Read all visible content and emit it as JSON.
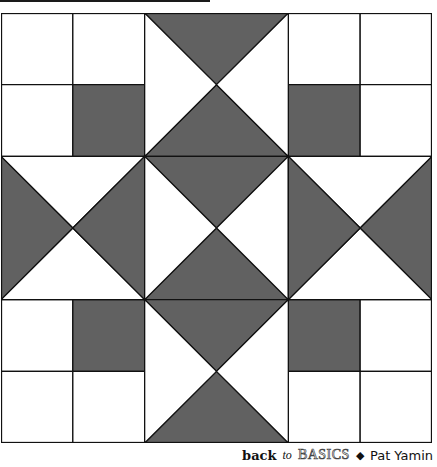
{
  "colors": {
    "fabric_dark": "#616161",
    "fabric_light": "#ffffff",
    "seam": "#111111"
  },
  "quilt": {
    "grid_units": 6,
    "four_patch_blocks": [
      {
        "position": "top-left",
        "x": 0,
        "y": 0,
        "dark_cell": "bottom-right"
      },
      {
        "position": "top-right",
        "x": 4,
        "y": 0,
        "dark_cell": "bottom-left"
      },
      {
        "position": "bottom-left",
        "x": 0,
        "y": 4,
        "dark_cell": "top-right"
      },
      {
        "position": "bottom-right",
        "x": 4,
        "y": 4,
        "dark_cell": "top-left"
      }
    ],
    "hourglass_blocks": [
      {
        "position": "top-center",
        "x": 2,
        "y": 0,
        "dark": [
          "top",
          "bottom"
        ]
      },
      {
        "position": "middle-left",
        "x": 0,
        "y": 2,
        "dark": [
          "left",
          "right"
        ]
      },
      {
        "position": "center",
        "x": 2,
        "y": 2,
        "dark": [
          "top",
          "bottom"
        ]
      },
      {
        "position": "middle-right",
        "x": 4,
        "y": 2,
        "dark": [
          "left",
          "right"
        ]
      },
      {
        "position": "bottom-center",
        "x": 2,
        "y": 4,
        "dark": [
          "top",
          "bottom"
        ]
      }
    ]
  },
  "caption": {
    "back": "back",
    "to": "to",
    "basics": "BASICS",
    "separator": "◆",
    "author": "Pat Yamin"
  }
}
